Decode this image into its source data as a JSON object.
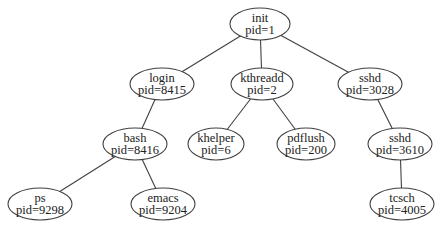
{
  "diagram": {
    "type": "process-tree",
    "nodes": [
      {
        "id": "init",
        "name": "init",
        "pid": "pid=1",
        "cx": 260,
        "cy": 24,
        "rx": 30,
        "ry": 16
      },
      {
        "id": "login",
        "name": "login",
        "pid": "pid=8415",
        "cx": 162,
        "cy": 84,
        "rx": 32,
        "ry": 16
      },
      {
        "id": "kthreadd",
        "name": "kthreadd",
        "pid": "pid=2",
        "cx": 262,
        "cy": 84,
        "rx": 31,
        "ry": 16
      },
      {
        "id": "sshd3028",
        "name": "sshd",
        "pid": "pid=3028",
        "cx": 370,
        "cy": 84,
        "rx": 32,
        "ry": 16
      },
      {
        "id": "bash",
        "name": "bash",
        "pid": "pid=8416",
        "cx": 135,
        "cy": 144,
        "rx": 32,
        "ry": 16
      },
      {
        "id": "khelper",
        "name": "khelper",
        "pid": "pid=6",
        "cx": 216,
        "cy": 144,
        "rx": 28,
        "ry": 16
      },
      {
        "id": "pdflush",
        "name": "pdflush",
        "pid": "pid=200",
        "cx": 306,
        "cy": 144,
        "rx": 29,
        "ry": 16
      },
      {
        "id": "sshd3610",
        "name": "sshd",
        "pid": "pid=3610",
        "cx": 400,
        "cy": 144,
        "rx": 32,
        "ry": 16
      },
      {
        "id": "ps",
        "name": "ps",
        "pid": "pid=9298",
        "cx": 40,
        "cy": 204,
        "rx": 32,
        "ry": 16
      },
      {
        "id": "emacs",
        "name": "emacs",
        "pid": "pid=9204",
        "cx": 163,
        "cy": 204,
        "rx": 32,
        "ry": 16
      },
      {
        "id": "tcsch",
        "name": "tcsch",
        "pid": "pid=4005",
        "cx": 402,
        "cy": 204,
        "rx": 32,
        "ry": 16
      }
    ],
    "edges": [
      {
        "from": "init",
        "to": "login"
      },
      {
        "from": "init",
        "to": "kthreadd"
      },
      {
        "from": "init",
        "to": "sshd3028"
      },
      {
        "from": "login",
        "to": "bash"
      },
      {
        "from": "kthreadd",
        "to": "khelper"
      },
      {
        "from": "kthreadd",
        "to": "pdflush"
      },
      {
        "from": "sshd3028",
        "to": "sshd3610"
      },
      {
        "from": "bash",
        "to": "ps"
      },
      {
        "from": "bash",
        "to": "emacs"
      },
      {
        "from": "sshd3610",
        "to": "tcsch"
      }
    ]
  }
}
